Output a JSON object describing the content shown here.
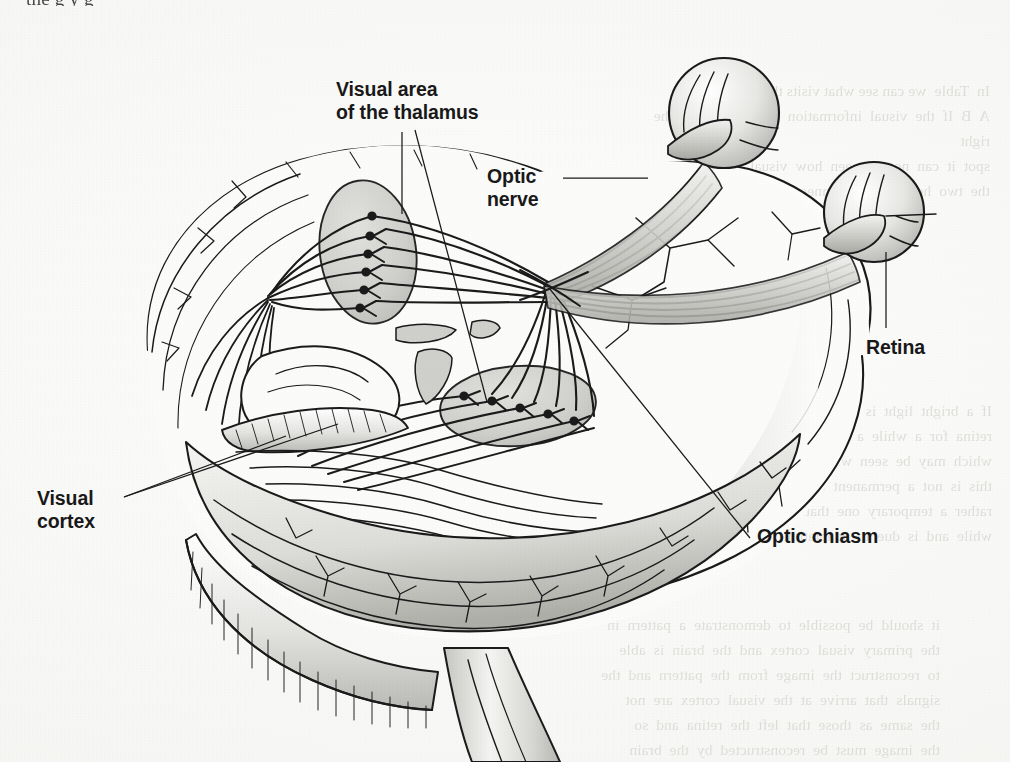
{
  "figure": {
    "kind": "anatomical-illustration",
    "background_color": "#f7f7f5",
    "ink_color": "#1a1a1a",
    "shade_color": "#c9c9c6"
  },
  "page": {
    "cut_off_top_line": "the  g   y     g"
  },
  "labels": {
    "visual_area_of_thalamus": "Visual area\nof the thalamus",
    "optic_nerve": "Optic\nnerve",
    "retina": "Retina",
    "visual_cortex": "Visual\ncortex",
    "optic_chiasm": "Optic chiasm"
  },
  "ghost_text": {
    "block_a": "In  Table  we can see what visits the brain makes\nA  B  If  the  visual  information  does  not  reach  the  right\nspot  it  can  not  be  seen  how  visual  cortex  in\nthe  two  hemispheres  connect  to  each  other",
    "block_b": "If  a  bright  light  is  shone  on  a  small  region  of  the\nretina  for  a  while  a  pattern  is  formed  there  the\nwhich  may  be  seen  when  looking  at  a  blank  wall\nthis  is  not  a  permanent  change  in  the  retina  but\nrather  a  temporary  one  that  fades  away  after  a\nwhile  and  is  due  to  adaptation  of  the  receptors",
    "block_c": "it  should  be  possible  to  demonstrate  a  pattern  in\nthe  primary  visual  cortex  and  the  brain  is  able\nto  reconstruct  the  image  from  the  pattern  and  the\nsignals  that  arrive  at  the  visual  cortex  are  not\nthe  same  as  those  that  left  the  retina  and  so\nthe  image  must  be  reconstructed  by  the  brain"
  }
}
